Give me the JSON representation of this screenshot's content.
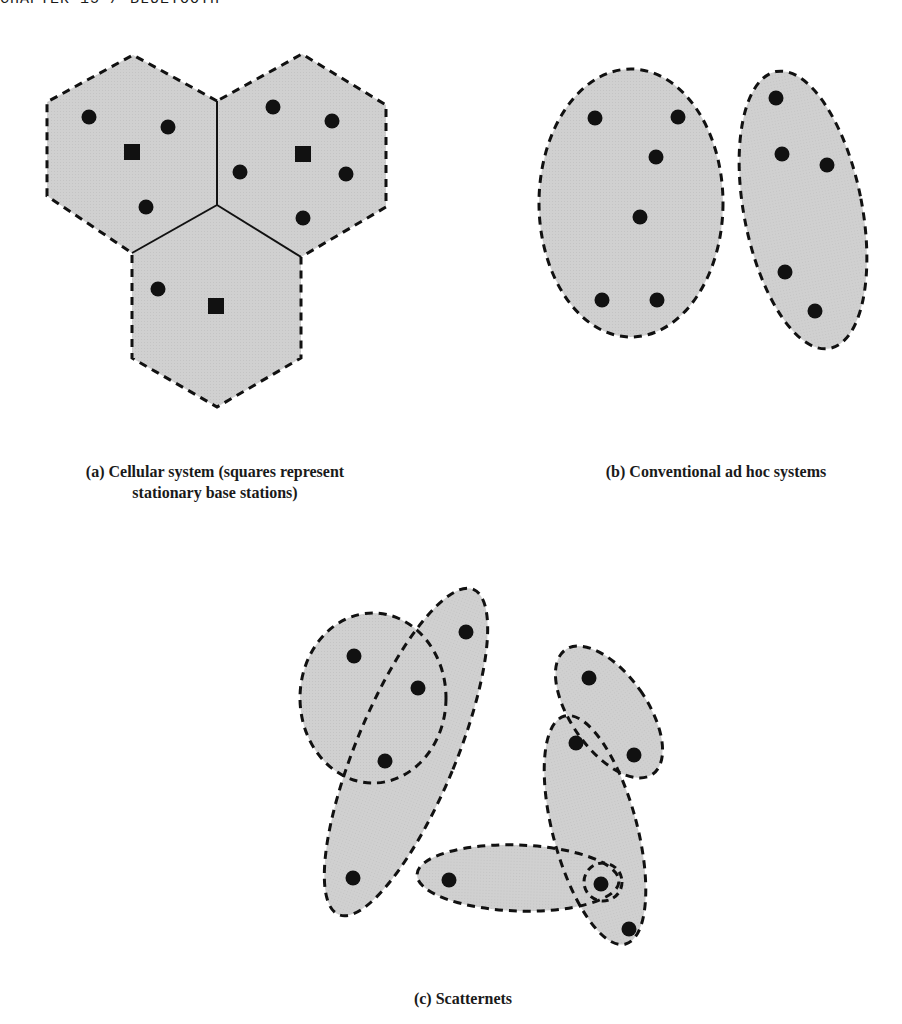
{
  "header": {
    "running_title": "CHAPTER 15 / BLUETOOTH"
  },
  "style": {
    "region_fill": "#cfcfcf",
    "outline_color": "#111111",
    "node_color": "#111111",
    "background": "#ffffff"
  },
  "legend": {
    "circle": "mobile device",
    "square": "stationary base station"
  },
  "panels": {
    "a": {
      "caption_line1": "(a) Cellular system (squares represent",
      "caption_line2": "stationary base stations)",
      "cells": [
        {
          "name": "cell-top-left",
          "base_station": [
            132,
            152
          ],
          "devices": [
            [
              89,
              117
            ],
            [
              168,
              127
            ],
            [
              146,
              207
            ]
          ]
        },
        {
          "name": "cell-top-right",
          "base_station": [
            303,
            154
          ],
          "devices": [
            [
              273,
              107
            ],
            [
              332,
              121
            ],
            [
              240,
              172
            ],
            [
              346,
              174
            ],
            [
              303,
              218
            ]
          ]
        },
        {
          "name": "cell-bottom",
          "base_station": [
            216,
            306
          ],
          "devices": [
            [
              158,
              289
            ]
          ]
        }
      ]
    },
    "b": {
      "caption": "(b) Conventional ad hoc systems",
      "groups": [
        {
          "name": "adhoc-group-left",
          "devices": [
            [
              595,
              118
            ],
            [
              678,
              117
            ],
            [
              656,
              157
            ],
            [
              640,
              217
            ],
            [
              602,
              300
            ],
            [
              657,
              300
            ]
          ]
        },
        {
          "name": "adhoc-group-right",
          "devices": [
            [
              776,
              98
            ],
            [
              782,
              154
            ],
            [
              827,
              165
            ],
            [
              785,
              272
            ],
            [
              815,
              311
            ]
          ]
        }
      ]
    },
    "c": {
      "caption": "(c) Scatternets",
      "piconets": 5,
      "devices": [
        [
          354,
          656
        ],
        [
          466,
          632
        ],
        [
          418,
          688
        ],
        [
          385,
          761
        ],
        [
          353,
          878
        ],
        [
          589,
          678
        ],
        [
          576,
          743
        ],
        [
          634,
          755
        ],
        [
          449,
          880
        ],
        [
          601,
          884
        ],
        [
          629,
          929
        ]
      ]
    }
  }
}
